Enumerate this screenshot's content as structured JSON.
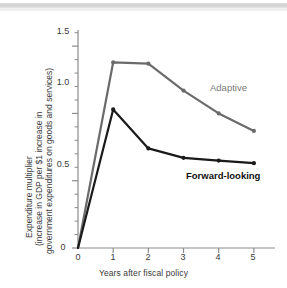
{
  "figure": {
    "background": "#ffffff",
    "scan_artifact": true
  },
  "chart_data": {
    "type": "line",
    "title": "",
    "xlabel": "Years after fiscal policy",
    "ylabel": "Expenditure multiplier (increase in GDP per $1 increase in government expenditures on goods and services)",
    "ylabel_lines": [
      "Expenditure multiplier",
      "(increase in GDP per $1 increase in",
      "government expenditures on goods and services)"
    ],
    "x": [
      0,
      1,
      2,
      3,
      4,
      5
    ],
    "xlim": [
      0,
      5.6
    ],
    "ylim": [
      0,
      1.62
    ],
    "xticks": [
      "0",
      "1",
      "2",
      "3",
      "4",
      "5"
    ],
    "yticks": [
      "0",
      "0.5",
      "1.0",
      "1.5"
    ],
    "ytick_values": [
      0,
      0.5,
      1.0,
      1.5
    ],
    "yminor_step": 0.1,
    "grid": false,
    "legend_position": "inline-annotation",
    "series": [
      {
        "name": "Adaptive",
        "color": "#6b6b6b",
        "values": [
          0,
          1.38,
          1.37,
          1.17,
          1.0,
          0.87
        ],
        "label_color": "#7a7a7a"
      },
      {
        "name": "Forward-looking",
        "color": "#1a1a1a",
        "values": [
          0,
          1.03,
          0.74,
          0.67,
          0.65,
          0.63
        ],
        "label_color": "#111111"
      }
    ],
    "annotations": [
      {
        "text": "Adaptive",
        "color": "#7a7a7a"
      },
      {
        "text": "Forward-looking",
        "color": "#111111"
      }
    ]
  },
  "axes": {
    "x_title": "Years after fiscal policy",
    "y_title_line1": "Expenditure multiplier",
    "y_title_line2": "(increase in GDP per $1 increase in",
    "y_title_line3": "government expenditures on goods and services)",
    "x_tick_labels": [
      "0",
      "1",
      "2",
      "3",
      "4",
      "5"
    ],
    "y_tick_labels": [
      "0",
      "0.5",
      "1.0",
      "1.5"
    ]
  },
  "labels": {
    "adaptive": "Adaptive",
    "forward_looking": "Forward-looking"
  }
}
